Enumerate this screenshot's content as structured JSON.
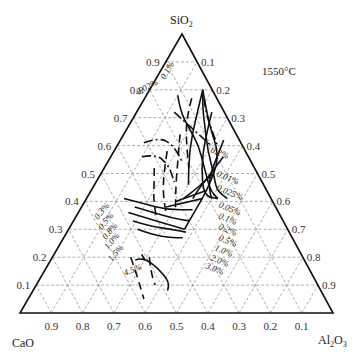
{
  "diagram": {
    "type": "ternary-phase-diagram",
    "temperature_label": "1550°C",
    "vertices": {
      "top": {
        "name": "SiO₂",
        "label_main": "SiO",
        "label_sub": "2"
      },
      "left": {
        "name": "CaO",
        "label_main": "CaO",
        "label_sub": ""
      },
      "right": {
        "name": "Al₂O₃",
        "label_main": "Al",
        "label_sub1": "2",
        "label_main2": "O",
        "label_sub2": "3"
      }
    },
    "left_axis_ticks": [
      "0.1",
      "0.2",
      "0.3",
      "0.4",
      "0.5",
      "0.6",
      "0.7",
      "0.8",
      "0.9"
    ],
    "right_axis_ticks": [
      "0.1",
      "0.2",
      "0.3",
      "0.4",
      "0.5",
      "0.6",
      "0.7",
      "0.8",
      "0.9"
    ],
    "bottom_axis_ticks": [
      "0.9",
      "0.8",
      "0.7",
      "0.6",
      "0.5",
      "0.4",
      "0.3",
      "0.2",
      "0.1"
    ],
    "grid_step": 0.1,
    "curve_labels_top": [
      "0.02%",
      "0.1%"
    ],
    "curve_labels_right": [
      "0.2%",
      "0.01%",
      "0.025%",
      "0.05%",
      "0.1%",
      "0.2%",
      "0.5%",
      "1.0%",
      "2.0%",
      "3.0%"
    ],
    "curve_labels_left": [
      "0.3%",
      "0.5%",
      "0.8%",
      "1.0%",
      "1.5%"
    ],
    "curve_labels_bottom": [
      "4.5%"
    ],
    "curves": [
      {
        "style": "solid",
        "label": "0.02%",
        "points": [
          [
            0.78,
            0.1
          ],
          [
            0.72,
            0.14
          ],
          [
            0.66,
            0.2
          ],
          [
            0.6,
            0.26
          ],
          [
            0.52,
            0.32
          ],
          [
            0.44,
            0.38
          ],
          [
            0.41,
            0.42
          ]
        ]
      },
      {
        "style": "solid",
        "label": "0.1%",
        "points": [
          [
            0.8,
            0.17
          ],
          [
            0.74,
            0.2
          ],
          [
            0.66,
            0.25
          ],
          [
            0.58,
            0.3
          ],
          [
            0.5,
            0.36
          ],
          [
            0.44,
            0.4
          ],
          [
            0.41,
            0.45
          ]
        ]
      },
      {
        "style": "solid",
        "label": "",
        "points": [
          [
            0.8,
            0.17
          ],
          [
            0.7,
            0.2
          ],
          [
            0.58,
            0.24
          ],
          [
            0.46,
            0.3
          ]
        ]
      },
      {
        "style": "solid",
        "label": "",
        "points": [
          [
            0.72,
            0.24
          ],
          [
            0.62,
            0.27
          ],
          [
            0.52,
            0.31
          ],
          [
            0.42,
            0.37
          ],
          [
            0.41,
            0.42
          ]
        ]
      },
      {
        "style": "solid",
        "label": "0.2%",
        "points": [
          [
            0.62,
            0.33
          ],
          [
            0.56,
            0.34
          ],
          [
            0.5,
            0.35
          ],
          [
            0.45,
            0.37
          ],
          [
            0.41,
            0.4
          ]
        ]
      },
      {
        "style": "solid",
        "label": "0.01%",
        "points": [
          [
            0.56,
            0.36
          ],
          [
            0.5,
            0.35
          ],
          [
            0.44,
            0.34
          ],
          [
            0.41,
            0.34
          ]
        ]
      },
      {
        "style": "solid",
        "label": "0.025%",
        "points": [
          [
            0.5,
            0.36
          ],
          [
            0.44,
            0.33
          ],
          [
            0.41,
            0.31
          ]
        ]
      },
      {
        "style": "solid",
        "label": "0.05%",
        "points": [
          [
            0.44,
            0.37
          ],
          [
            0.4,
            0.29
          ]
        ]
      },
      {
        "style": "solid",
        "label": "0.1%",
        "points": [
          [
            0.41,
            0.37
          ],
          [
            0.38,
            0.27
          ]
        ]
      },
      {
        "style": "solid",
        "label": "right-boundary",
        "points": [
          [
            0.8,
            0.17
          ],
          [
            0.68,
            0.25
          ],
          [
            0.56,
            0.35
          ],
          [
            0.44,
            0.37
          ],
          [
            0.36,
            0.37
          ],
          [
            0.3,
            0.37
          ]
        ]
      },
      {
        "style": "solid",
        "label": "0.3%",
        "points": [
          [
            0.41,
            0.12
          ],
          [
            0.39,
            0.2
          ],
          [
            0.37,
            0.28
          ],
          [
            0.37,
            0.36
          ]
        ]
      },
      {
        "style": "solid",
        "label": "0.5%",
        "points": [
          [
            0.38,
            0.17
          ],
          [
            0.36,
            0.24
          ],
          [
            0.34,
            0.31
          ],
          [
            0.33,
            0.37
          ]
        ]
      },
      {
        "style": "solid",
        "label": "0.8%",
        "points": [
          [
            0.36,
            0.16
          ],
          [
            0.34,
            0.23
          ],
          [
            0.32,
            0.3
          ],
          [
            0.3,
            0.37
          ]
        ]
      },
      {
        "style": "solid",
        "label": "1.0%",
        "points": [
          [
            0.33,
            0.19
          ],
          [
            0.31,
            0.26
          ],
          [
            0.3,
            0.33
          ],
          [
            0.29,
            0.38
          ]
        ]
      },
      {
        "style": "solid",
        "label": "1.5%",
        "points": [
          [
            0.3,
            0.22
          ],
          [
            0.28,
            0.28
          ],
          [
            0.27,
            0.34
          ],
          [
            0.27,
            0.38
          ]
        ]
      },
      {
        "style": "solid",
        "label": "4.5%",
        "points": [
          [
            0.19,
            0.27
          ],
          [
            0.2,
            0.29
          ],
          [
            0.16,
            0.36
          ],
          [
            0.11,
            0.42
          ],
          [
            0.08,
            0.43
          ]
        ]
      },
      {
        "style": "solid",
        "label": "",
        "points": [
          [
            0.19,
            0.3
          ],
          [
            0.21,
            0.28
          ]
        ]
      },
      {
        "style": "dashed",
        "label": "",
        "points": [
          [
            0.64,
            0.18
          ],
          [
            0.55,
            0.22
          ],
          [
            0.46,
            0.26
          ],
          [
            0.38,
            0.3
          ]
        ]
      },
      {
        "style": "dashed",
        "label": "",
        "points": [
          [
            0.58,
            0.17
          ],
          [
            0.5,
            0.2
          ],
          [
            0.42,
            0.24
          ],
          [
            0.36,
            0.28
          ]
        ]
      },
      {
        "style": "dashed",
        "label": "",
        "points": [
          [
            0.52,
            0.16
          ],
          [
            0.46,
            0.19
          ],
          [
            0.4,
            0.22
          ],
          [
            0.34,
            0.26
          ]
        ]
      },
      {
        "style": "dashed",
        "label": "",
        "points": [
          [
            0.77,
            0.15
          ],
          [
            0.7,
            0.17
          ],
          [
            0.62,
            0.21
          ],
          [
            0.52,
            0.27
          ]
        ]
      },
      {
        "style": "dashed",
        "label": "",
        "points": [
          [
            0.2,
            0.25
          ],
          [
            0.14,
            0.3
          ],
          [
            0.05,
            0.37
          ]
        ]
      },
      {
        "style": "dashed",
        "label": "",
        "points": [
          [
            0.2,
            0.31
          ],
          [
            0.15,
            0.34
          ],
          [
            0.1,
            0.38
          ]
        ]
      },
      {
        "style": "dashdot",
        "label": "",
        "points": [
          [
            0.61,
            0.08
          ],
          [
            0.63,
            0.12
          ],
          [
            0.6,
            0.18
          ],
          [
            0.54,
            0.24
          ]
        ]
      },
      {
        "style": "dashdot",
        "label": "",
        "points": [
          [
            0.56,
            0.1
          ],
          [
            0.57,
            0.14
          ],
          [
            0.53,
            0.2
          ],
          [
            0.47,
            0.25
          ]
        ]
      },
      {
        "style": "dashdot",
        "label": "",
        "points": [
          [
            0.72,
            0.12
          ],
          [
            0.68,
            0.18
          ],
          [
            0.64,
            0.24
          ],
          [
            0.6,
            0.3
          ]
        ]
      },
      {
        "style": "dashdot",
        "label": "",
        "points": [
          [
            0.77,
            0.19
          ],
          [
            0.72,
            0.22
          ],
          [
            0.66,
            0.27
          ],
          [
            0.6,
            0.32
          ]
        ]
      }
    ]
  }
}
